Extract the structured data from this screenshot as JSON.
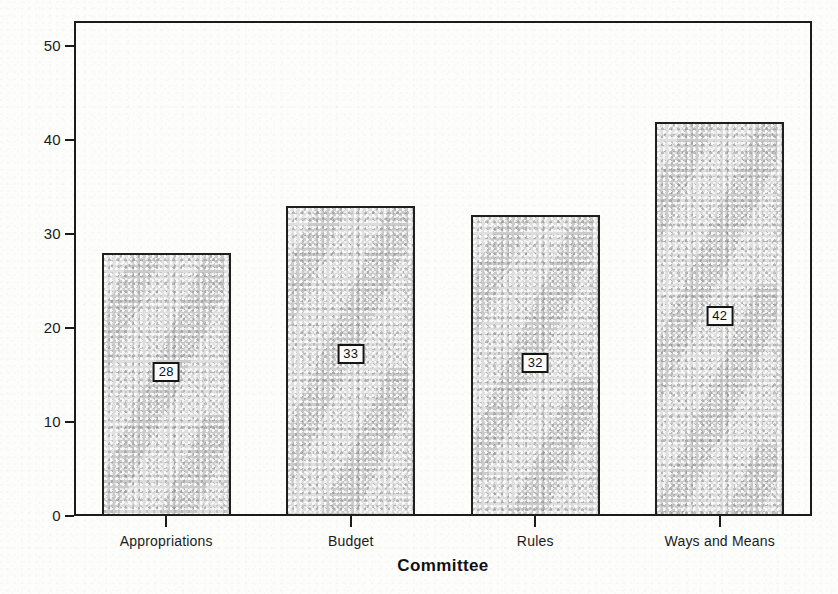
{
  "chart_data": {
    "type": "bar",
    "title": "",
    "subtitle": "",
    "xlabel": "Committee",
    "ylabel": "Percent Lobby",
    "categories": [
      "Appropriations",
      "Budget",
      "Rules",
      "Ways and Means"
    ],
    "values": [
      28,
      33,
      32,
      42
    ],
    "data_labels": [
      "28",
      "33",
      "32",
      "42"
    ],
    "ylim": [
      0,
      52.7
    ],
    "yticks": [
      0,
      10,
      20,
      30,
      40,
      50
    ],
    "ytick_labels": [
      "0",
      "10",
      "20",
      "30",
      "40",
      "50"
    ],
    "grid": false,
    "legend": null,
    "annotations": [],
    "series": [
      {
        "name": "Percent Lobby",
        "values": [
          28,
          33,
          32,
          42
        ]
      }
    ]
  },
  "style": {
    "bar_fill": "#d4d4d4",
    "bar_edge": "#1f1f1f",
    "axis_color": "#1b1b1b",
    "text_color": "#111111",
    "background": "#fdfdfc"
  },
  "labels": {
    "y_axis_title": "Percent Lobby",
    "x_axis_title": "Committee"
  }
}
